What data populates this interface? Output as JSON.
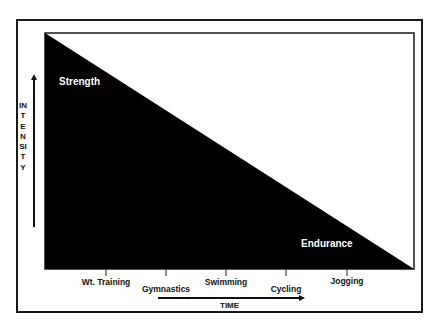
{
  "diagram": {
    "type": "tradeoff-triangle",
    "y_axis": {
      "label": "INTENSITY",
      "direction": "up"
    },
    "x_axis": {
      "label": "TIME",
      "direction": "right"
    },
    "regions": {
      "top_left": "Strength",
      "bottom_right": "Endurance"
    },
    "activities": [
      {
        "label": "Wt. Training",
        "order": 1,
        "row": "upper"
      },
      {
        "label": "Gymnastics",
        "order": 2,
        "row": "lower"
      },
      {
        "label": "Swimming",
        "order": 3,
        "row": "upper"
      },
      {
        "label": "Cycling",
        "order": 4,
        "row": "lower"
      },
      {
        "label": "Jogging",
        "order": 5,
        "row": "upper"
      }
    ],
    "colors": {
      "fill": "#000000",
      "background": "#ffffff",
      "line": "#1a1a1a"
    }
  }
}
